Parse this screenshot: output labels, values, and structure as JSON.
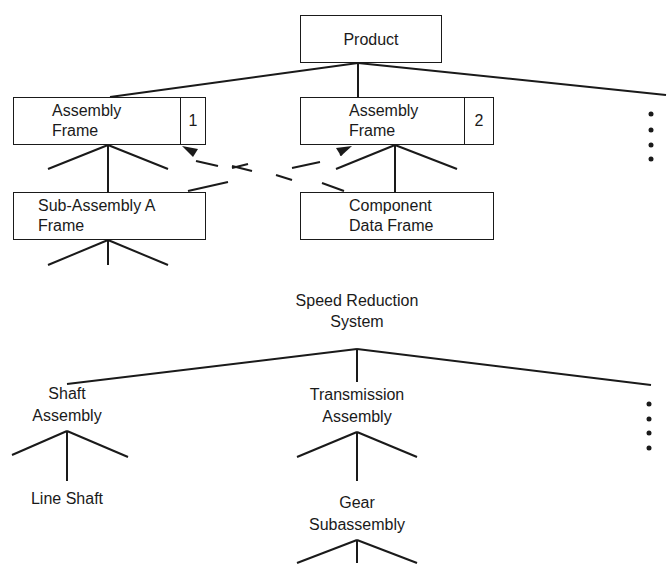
{
  "diagram_top": {
    "root": {
      "label": "Product"
    },
    "nodes": [
      {
        "id": "assembly-frame-1",
        "line1": "Assembly",
        "line2": "Frame",
        "tag": "1"
      },
      {
        "id": "assembly-frame-2",
        "line1": "Assembly",
        "line2": "Frame",
        "tag": "2"
      },
      {
        "id": "sub-assembly-a-frame",
        "line1": "Sub-Assembly A",
        "line2": "Frame"
      },
      {
        "id": "component-data-frame",
        "line1": "Component",
        "line2": "Data Frame"
      }
    ],
    "continuation": "ellipsis-dots"
  },
  "diagram_bottom": {
    "root": {
      "line1": "Speed Reduction",
      "line2": "System"
    },
    "nodes": [
      {
        "id": "shaft-assembly",
        "line1": "Shaft",
        "line2": "Assembly"
      },
      {
        "id": "transmission-assembly",
        "line1": "Transmission",
        "line2": "Assembly"
      },
      {
        "id": "line-shaft",
        "line1": "Line Shaft"
      },
      {
        "id": "gear-subassembly",
        "line1": "Gear",
        "line2": "Subassembly"
      }
    ],
    "continuation": "ellipsis-dots"
  },
  "colors": {
    "ink": "#1a1a1a",
    "background": "#ffffff"
  }
}
